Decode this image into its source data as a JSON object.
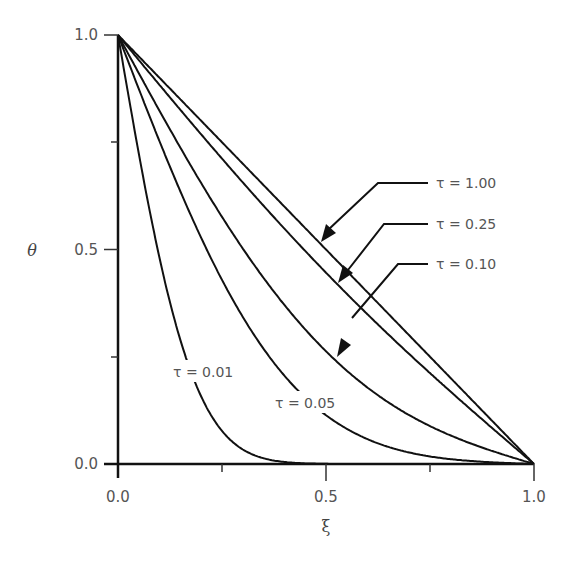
{
  "chart_data": {
    "type": "line",
    "title": "",
    "xlabel": "ξ",
    "ylabel": "θ",
    "xlim": [
      0,
      1
    ],
    "ylim": [
      0,
      1
    ],
    "grid": false,
    "x_ticks": [
      "0.0",
      "0.5",
      "1.0"
    ],
    "y_ticks": [
      "0.0",
      "0.5",
      "1.0"
    ],
    "x_minor_ticks": [
      0.25,
      0.75
    ],
    "y_minor_ticks": [
      0.25,
      0.75
    ],
    "series": [
      {
        "name": "τ=0.01",
        "tau": 0.01,
        "x": [
          0,
          0.05,
          0.1,
          0.15,
          0.2,
          0.25,
          0.3,
          0.35,
          0.4,
          0.5,
          1.0
        ],
        "values": [
          1.0,
          0.72,
          0.48,
          0.29,
          0.16,
          0.08,
          0.03,
          0.01,
          0.0,
          0.0,
          0.0
        ]
      },
      {
        "name": "τ=0.05",
        "tau": 0.05,
        "x": [
          0,
          0.1,
          0.2,
          0.3,
          0.4,
          0.5,
          0.6,
          0.7,
          0.8,
          0.9,
          1.0
        ],
        "values": [
          1.0,
          0.75,
          0.53,
          0.34,
          0.21,
          0.12,
          0.06,
          0.03,
          0.01,
          0.0,
          0.0
        ]
      },
      {
        "name": "τ=0.10",
        "tau": 0.1,
        "x": [
          0,
          0.1,
          0.2,
          0.3,
          0.4,
          0.5,
          0.6,
          0.7,
          0.8,
          0.9,
          1.0
        ],
        "values": [
          1.0,
          0.82,
          0.65,
          0.5,
          0.37,
          0.27,
          0.19,
          0.12,
          0.07,
          0.03,
          0.0
        ]
      },
      {
        "name": "τ=0.25",
        "tau": 0.25,
        "x": [
          0,
          0.1,
          0.2,
          0.3,
          0.4,
          0.5,
          0.6,
          0.7,
          0.8,
          0.9,
          1.0
        ],
        "values": [
          1.0,
          0.86,
          0.73,
          0.61,
          0.49,
          0.39,
          0.29,
          0.2,
          0.13,
          0.06,
          0.0
        ]
      },
      {
        "name": "τ=1.00",
        "tau": 1.0,
        "x": [
          0,
          0.1,
          0.2,
          0.3,
          0.4,
          0.5,
          0.6,
          0.7,
          0.8,
          0.9,
          1.0
        ],
        "values": [
          1.0,
          0.9,
          0.8,
          0.7,
          0.6,
          0.5,
          0.4,
          0.3,
          0.2,
          0.1,
          0.0
        ]
      }
    ],
    "annotations": [
      {
        "text": "τ = 1.00",
        "arrow": true
      },
      {
        "text": "τ = 0.25",
        "arrow": true
      },
      {
        "text": "τ = 0.10",
        "arrow": true
      },
      {
        "text": "τ = 0.05",
        "arrow": false
      },
      {
        "text": "τ = 0.01",
        "arrow": false
      }
    ]
  },
  "labels": {
    "y_axis": "θ",
    "x_axis": "ξ",
    "y_tick_0": "0.0",
    "y_tick_05": "0.5",
    "y_tick_1": "1.0",
    "x_tick_0": "0.0",
    "x_tick_05": "0.5",
    "x_tick_1": "1.0",
    "tau_100": "τ = 1.00",
    "tau_025": "τ = 0.25",
    "tau_010": "τ = 0.10",
    "tau_005": "τ = 0.05",
    "tau_001": "τ = 0.01"
  }
}
